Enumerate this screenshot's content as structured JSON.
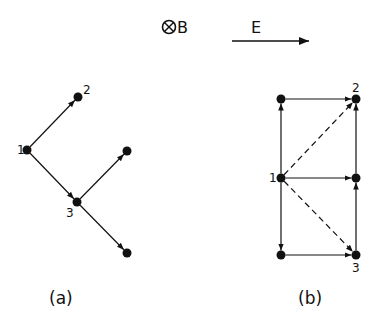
{
  "header": {
    "b_field_symbol": "⊗",
    "b_field_label": "B",
    "e_field_label": "E"
  },
  "diagram_a": {
    "caption": "(a)",
    "nodes": [
      {
        "id": "1",
        "label": "1",
        "x": 27,
        "y": 150
      },
      {
        "id": "2",
        "label": "2",
        "x": 78,
        "y": 97
      },
      {
        "id": "3",
        "label": "3",
        "x": 77,
        "y": 202
      },
      {
        "id": "4",
        "label": "",
        "x": 127,
        "y": 151
      },
      {
        "id": "5",
        "label": "",
        "x": 127,
        "y": 253
      }
    ],
    "edges": [
      {
        "from": "1",
        "to": "2",
        "style": "solid"
      },
      {
        "from": "1",
        "to": "3",
        "style": "solid"
      },
      {
        "from": "3",
        "to": "4",
        "style": "solid"
      },
      {
        "from": "3",
        "to": "5",
        "style": "solid"
      }
    ]
  },
  "diagram_b": {
    "caption": "(b)",
    "nodes": [
      {
        "id": "tl",
        "label": "",
        "x": 281,
        "y": 99
      },
      {
        "id": "2",
        "label": "2",
        "x": 356,
        "y": 99
      },
      {
        "id": "1",
        "label": "1",
        "x": 281,
        "y": 178
      },
      {
        "id": "mr",
        "label": "",
        "x": 356,
        "y": 178
      },
      {
        "id": "bl",
        "label": "",
        "x": 281,
        "y": 255
      },
      {
        "id": "3",
        "label": "3",
        "x": 356,
        "y": 255
      }
    ],
    "edges": [
      {
        "from": "1",
        "to": "tl",
        "style": "solid"
      },
      {
        "from": "tl",
        "to": "2",
        "style": "solid"
      },
      {
        "from": "1",
        "to": "mr",
        "style": "solid"
      },
      {
        "from": "mr",
        "to": "2",
        "style": "solid"
      },
      {
        "from": "1",
        "to": "bl",
        "style": "solid"
      },
      {
        "from": "bl",
        "to": "3",
        "style": "solid"
      },
      {
        "from": "3",
        "to": "mr",
        "style": "solid"
      },
      {
        "from": "1",
        "to": "2",
        "style": "dashed"
      },
      {
        "from": "1",
        "to": "3",
        "style": "dashed"
      }
    ]
  },
  "colors": {
    "ink": "#111111",
    "background": "#ffffff"
  }
}
